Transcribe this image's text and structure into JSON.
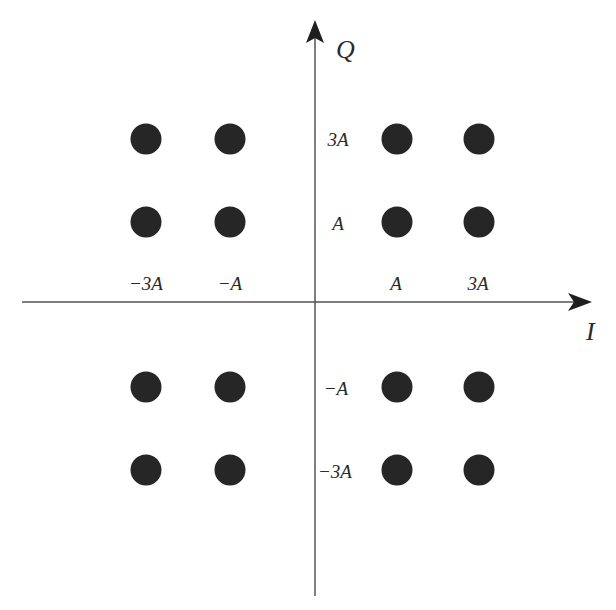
{
  "chart_data": {
    "type": "scatter",
    "title": "",
    "subtitle": "16-QAM constellation",
    "xlabel": "I",
    "ylabel": "Q",
    "grid": false,
    "legend": null,
    "x_ticks": [
      {
        "value": -3,
        "label": "−3A"
      },
      {
        "value": -1,
        "label": "−A"
      },
      {
        "value": 1,
        "label": "A"
      },
      {
        "value": 3,
        "label": "3A"
      }
    ],
    "y_ticks": [
      {
        "value": 3,
        "label": "3A"
      },
      {
        "value": 1,
        "label": "A"
      },
      {
        "value": -1,
        "label": "−A"
      },
      {
        "value": -3,
        "label": "−3A"
      }
    ],
    "xlim": [
      -4,
      4
    ],
    "ylim": [
      -4,
      4
    ],
    "unit": "A",
    "series": [
      {
        "name": "constellation points",
        "color": "#262626",
        "points": [
          {
            "x": -3,
            "y": 3
          },
          {
            "x": -1,
            "y": 3
          },
          {
            "x": 1,
            "y": 3
          },
          {
            "x": 3,
            "y": 3
          },
          {
            "x": -3,
            "y": 1
          },
          {
            "x": -1,
            "y": 1
          },
          {
            "x": 1,
            "y": 1
          },
          {
            "x": 3,
            "y": 1
          },
          {
            "x": -3,
            "y": -1
          },
          {
            "x": -1,
            "y": -1
          },
          {
            "x": 1,
            "y": -1
          },
          {
            "x": 3,
            "y": -1
          },
          {
            "x": -3,
            "y": -3
          },
          {
            "x": -1,
            "y": -3
          },
          {
            "x": 1,
            "y": -3
          },
          {
            "x": 3,
            "y": -3
          }
        ]
      }
    ]
  },
  "colors": {
    "axis": "#555555",
    "point": "#262626",
    "text": "#2a2a2a",
    "background": "#ffffff"
  }
}
